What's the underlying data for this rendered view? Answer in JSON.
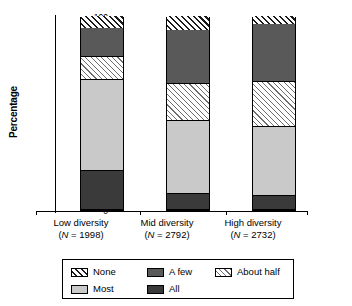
{
  "chart_data": {
    "type": "bar",
    "subtype": "stacked-bar-100",
    "title": "",
    "xlabel": "",
    "ylabel": "Percentage",
    "ylim": [
      0,
      100
    ],
    "yticks": [
      100,
      90,
      80,
      70,
      60,
      50,
      40,
      30,
      20,
      10,
      0
    ],
    "grid": false,
    "legend_position": "bottom",
    "categories": [
      "Low diversity",
      "Mid diversity",
      "High diversity"
    ],
    "category_sublabels": [
      "(N = 1998)",
      "(N = 2792)",
      "(N = 2732)"
    ],
    "category_n": [
      1998,
      2792,
      2732
    ],
    "stack_order_bottom_to_top": [
      "All",
      "Most",
      "About half",
      "A few",
      "None"
    ],
    "series": [
      {
        "name": "All",
        "values": [
          20,
          8,
          7
        ],
        "fill": "solid-dark",
        "color": "#3a3a3a"
      },
      {
        "name": "Most",
        "values": [
          47,
          38,
          36
        ],
        "fill": "solid-light-gray",
        "color": "#c9c9c9"
      },
      {
        "name": "About half",
        "values": [
          12,
          19,
          23
        ],
        "fill": "sparse-diagonal-hatch",
        "color": "#ffffff"
      },
      {
        "name": "A few",
        "values": [
          15,
          28,
          30
        ],
        "fill": "solid-mid-gray",
        "color": "#595959"
      },
      {
        "name": "None",
        "values": [
          6,
          7,
          4
        ],
        "fill": "bold-diagonal-hatch",
        "color": "#ffffff"
      }
    ],
    "cumulative_tops": {
      "Low diversity": {
        "All": 20,
        "Most": 67,
        "About half": 79,
        "A few": 94,
        "None": 100
      },
      "Mid diversity": {
        "All": 8,
        "Most": 46,
        "About half": 65,
        "A few": 93,
        "None": 100
      },
      "High diversity": {
        "All": 7,
        "Most": 43,
        "About half": 66,
        "A few": 96,
        "None": 100
      }
    }
  },
  "legend": {
    "rows": [
      [
        {
          "label": "None",
          "series": "None"
        },
        {
          "label": "A few",
          "series": "A few"
        },
        {
          "label": "About half",
          "series": "About half"
        }
      ],
      [
        {
          "label": "Most",
          "series": "Most"
        },
        {
          "label": "All",
          "series": "All"
        }
      ]
    ]
  },
  "axis": {
    "y_label": "Percentage",
    "y_tick_labels": [
      "100",
      "90",
      "80",
      "70",
      "60",
      "50",
      "40",
      "30",
      "20",
      "10",
      "0"
    ]
  },
  "colors": {
    "all": "#3a3a3a",
    "most": "#c9c9c9",
    "a_few": "#595959",
    "hatch_dark": "#1a1a1a",
    "hatch_light": "#6e6e6e",
    "axis": "#000000",
    "background": "#ffffff"
  }
}
